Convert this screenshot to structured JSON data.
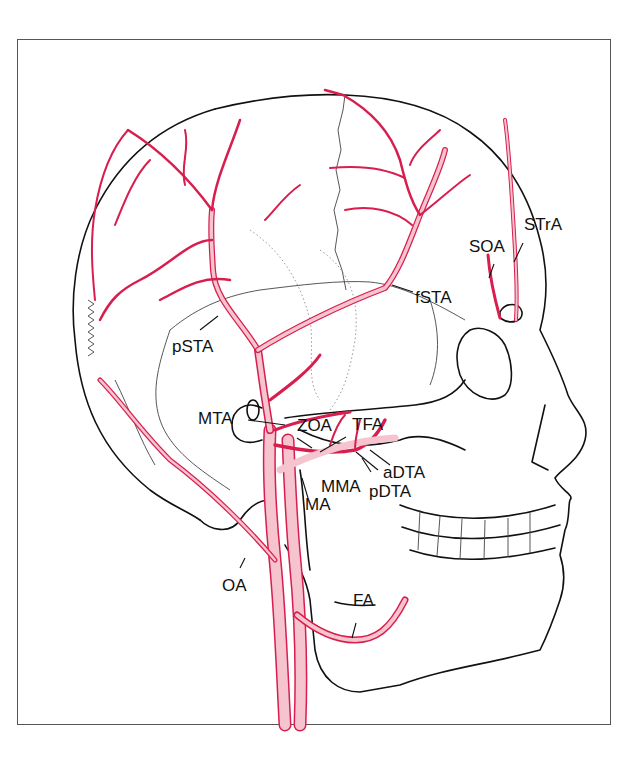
{
  "figure": {
    "colors": {
      "artery_stroke": "#d81e4e",
      "artery_fill": "#f6c4cf",
      "bone_line": "#111111",
      "suture_line": "#444444",
      "frame": "#555555",
      "background": "#ffffff"
    }
  },
  "labels": {
    "soa": "SOA",
    "stra": "STrA",
    "fsta": "fSTA",
    "psta": "pSTA",
    "mta": "MTA",
    "zoa": "ZOA",
    "tfa": "TFA",
    "adta": "aDTA",
    "mma": "MMA",
    "pdta": "pDTA",
    "ma": "MA",
    "oa": "OA",
    "fa": "FA"
  }
}
